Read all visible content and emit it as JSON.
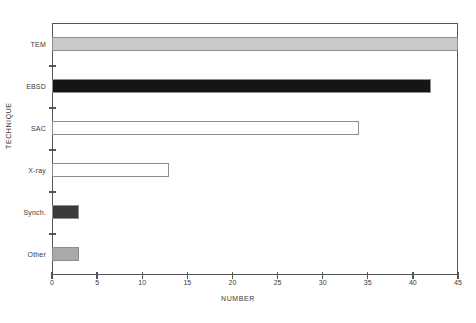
{
  "chart_data": {
    "type": "bar",
    "orientation": "horizontal",
    "title": "",
    "xlabel": "NUMBER",
    "ylabel": "TECHNIQUE",
    "categories": [
      "TEM",
      "EBSD",
      "SAC",
      "X-ray",
      "Synch.",
      "Other"
    ],
    "values": [
      45,
      42,
      34,
      13,
      3,
      3
    ],
    "bar_colors": [
      "#c9c9c9",
      "#151515",
      "#ffffff",
      "#ffffff",
      "#3a3a3a",
      "#a9a9a9"
    ],
    "bar_edge_color": "#8e8e8e",
    "xlim": [
      0,
      45
    ],
    "xticks": [
      0,
      5,
      10,
      15,
      20,
      25,
      30,
      35,
      40,
      45
    ],
    "xtick_labels": [
      "0",
      "5",
      "10",
      "15",
      "20",
      "25",
      "30",
      "35",
      "40",
      "45"
    ],
    "grid": false,
    "legend": "none",
    "frame_color": "#555555",
    "background": "#ffffff"
  }
}
